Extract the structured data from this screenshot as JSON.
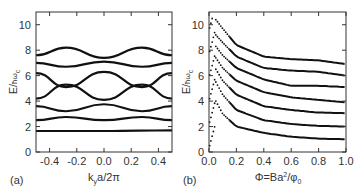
{
  "chart_data": [
    {
      "panel": "(a)",
      "type": "line",
      "title": "",
      "xlabel": "k_y a/2π",
      "ylabel": "E/ħω_c",
      "xlim": [
        -0.5,
        0.5
      ],
      "ylim": [
        0,
        11
      ],
      "xticks": [
        -0.4,
        -0.2,
        0.0,
        0.2,
        0.4
      ],
      "xtick_labels": [
        "-0.4",
        "-0.2",
        "0.0",
        "0.2",
        "0.4"
      ],
      "yticks": [
        0,
        2,
        4,
        6,
        8,
        10
      ],
      "ytick_labels": [
        "0",
        "2",
        "4",
        "6",
        "8",
        "10"
      ],
      "grid": false,
      "series": [
        {
          "name": "band1",
          "x": [
            -0.5,
            -0.25,
            0.0,
            0.25,
            0.5
          ],
          "values": [
            1.65,
            1.65,
            1.65,
            1.68,
            1.7
          ]
        },
        {
          "name": "band2",
          "x": [
            -0.5,
            -0.28,
            0.0,
            0.28,
            0.5
          ],
          "values": [
            2.5,
            2.75,
            2.5,
            2.75,
            2.5
          ]
        },
        {
          "name": "band3",
          "x": [
            -0.5,
            -0.28,
            0.0,
            0.28,
            0.5
          ],
          "values": [
            3.6,
            3.2,
            3.75,
            3.2,
            3.6
          ]
        },
        {
          "name": "band4",
          "x": [
            -0.5,
            -0.28,
            0.0,
            0.28,
            0.5
          ],
          "values": [
            4.2,
            5.3,
            4.1,
            5.3,
            4.2
          ]
        },
        {
          "name": "band5",
          "x": [
            -0.5,
            -0.28,
            0.0,
            0.28,
            0.5
          ],
          "values": [
            6.2,
            5.1,
            6.3,
            5.1,
            6.2
          ]
        },
        {
          "name": "band6",
          "x": [
            -0.5,
            -0.28,
            0.0,
            0.28,
            0.5
          ],
          "values": [
            7.0,
            6.7,
            7.1,
            6.7,
            7.0
          ]
        },
        {
          "name": "band7",
          "x": [
            -0.5,
            -0.28,
            0.0,
            0.28,
            0.5
          ],
          "values": [
            7.6,
            8.2,
            7.4,
            8.2,
            7.6
          ]
        }
      ]
    },
    {
      "panel": "(b)",
      "type": "line",
      "title": "",
      "xlabel": "Φ=Ba²/φ₀",
      "ylabel": "E/ħω_c",
      "xlim": [
        0.0,
        1.0
      ],
      "ylim": [
        0,
        11
      ],
      "xticks": [
        0.0,
        0.2,
        0.4,
        0.6,
        0.8,
        1.0
      ],
      "xtick_labels": [
        "0.0",
        "0.2",
        "0.4",
        "0.6",
        "0.8",
        "1.0"
      ],
      "yticks": [
        0,
        2,
        4,
        6,
        8,
        10
      ],
      "ytick_labels": [
        "0",
        "2",
        "4",
        "6",
        "8",
        "10"
      ],
      "grid": false,
      "series": [
        {
          "name": "level1",
          "x": [
            0.05,
            0.1,
            0.2,
            0.4,
            0.6,
            0.8,
            1.0
          ],
          "values": [
            4.0,
            3.0,
            2.0,
            1.5,
            1.2,
            1.05,
            1.0
          ]
        },
        {
          "name": "level2",
          "x": [
            0.05,
            0.1,
            0.2,
            0.4,
            0.6,
            0.8,
            1.0
          ],
          "values": [
            5.5,
            4.5,
            3.3,
            2.5,
            2.2,
            2.05,
            2.0
          ]
        },
        {
          "name": "level3",
          "x": [
            0.05,
            0.1,
            0.2,
            0.4,
            0.6,
            0.8,
            1.0
          ],
          "values": [
            6.5,
            5.6,
            4.5,
            3.6,
            3.3,
            3.1,
            3.05
          ]
        },
        {
          "name": "level4",
          "x": [
            0.05,
            0.1,
            0.2,
            0.4,
            0.6,
            0.8,
            1.0
          ],
          "values": [
            7.4,
            6.6,
            5.6,
            4.7,
            4.3,
            4.1,
            3.9
          ]
        },
        {
          "name": "level5",
          "x": [
            0.05,
            0.1,
            0.2,
            0.4,
            0.6,
            0.8,
            1.0
          ],
          "values": [
            8.3,
            7.6,
            6.6,
            5.7,
            5.2,
            5.2,
            5.1
          ]
        },
        {
          "name": "level6",
          "x": [
            0.05,
            0.1,
            0.2,
            0.4,
            0.6,
            0.8,
            1.0
          ],
          "values": [
            9.2,
            8.6,
            7.5,
            6.6,
            6.4,
            6.3,
            6.0
          ]
        },
        {
          "name": "level7",
          "x": [
            0.05,
            0.1,
            0.2,
            0.4,
            0.6,
            0.8,
            1.0
          ],
          "values": [
            10.4,
            9.7,
            8.4,
            7.5,
            7.3,
            7.2,
            6.9
          ]
        }
      ]
    }
  ],
  "panels": {
    "a": {
      "label": "(a)",
      "ylabel_main": "E/",
      "ylabel_h": "ħω",
      "ylabel_sub": "c",
      "xlabel_k": "k",
      "xlabel_sub": "y",
      "xlabel_rest": "a/2π"
    },
    "b": {
      "label": "(b)",
      "ylabel_main": "E/",
      "ylabel_h": "ħω",
      "ylabel_sub": "c",
      "xlabel_main": "Φ=Ba",
      "xlabel_sup": "2",
      "xlabel_slash": "/φ",
      "xlabel_sub": "0"
    }
  },
  "colors": {
    "curve": "#111111",
    "axis": "#333333"
  }
}
